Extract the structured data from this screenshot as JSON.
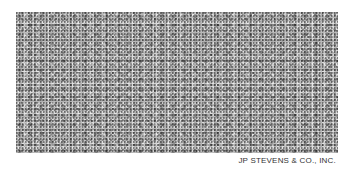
{
  "image": {
    "description": "Grayscale fabric texture swatch",
    "background_color": "#ffffff",
    "swatch_tone": "#b8b8b8"
  },
  "caption": {
    "text": "JP STEVENS & CO., INC."
  }
}
